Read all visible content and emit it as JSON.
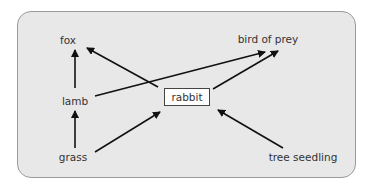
{
  "diagram": {
    "type": "food-web",
    "colors": {
      "panel_bg": "#e8e8e8",
      "panel_border": "#9a9a9a",
      "arrow": "#111111",
      "text": "#333333",
      "highlight_box_bg": "#ffffff"
    },
    "nodes": {
      "fox": "fox",
      "bird_of_prey": "bird of prey",
      "lamb": "lamb",
      "rabbit": "rabbit",
      "grass": "grass",
      "tree_seedling": "tree seedling"
    },
    "edges": [
      {
        "from": "lamb",
        "to": "fox"
      },
      {
        "from": "grass",
        "to": "lamb"
      },
      {
        "from": "rabbit",
        "to": "fox"
      },
      {
        "from": "lamb",
        "to": "bird of prey"
      },
      {
        "from": "rabbit",
        "to": "bird of prey"
      },
      {
        "from": "grass",
        "to": "rabbit"
      },
      {
        "from": "tree seedling",
        "to": "rabbit"
      }
    ],
    "highlighted_node": "rabbit"
  }
}
